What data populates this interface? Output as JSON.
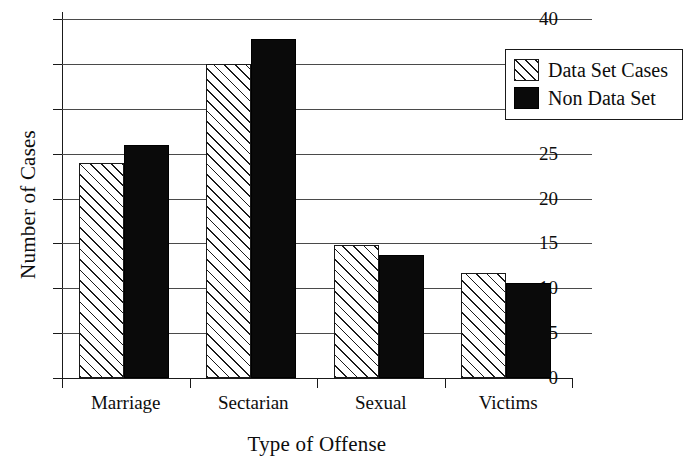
{
  "chart_data": {
    "type": "bar",
    "title": "",
    "xlabel": "Type of Offense",
    "ylabel": "Number of Cases",
    "categories": [
      "Marriage",
      "Sectarian",
      "Sexual",
      "Victims"
    ],
    "series": [
      {
        "name": "Data Set Cases",
        "fill": "hatched",
        "values": [
          24,
          35,
          14.8,
          11.7
        ]
      },
      {
        "name": "Non Data Set",
        "fill": "solid",
        "values": [
          26,
          37.8,
          13.7,
          10.6
        ]
      }
    ],
    "ylim": [
      0,
      40
    ],
    "yticks": [
      0,
      5,
      10,
      15,
      20,
      25,
      30,
      35,
      40
    ],
    "ytick_labels": [
      "0",
      "5",
      "10",
      "15",
      "20",
      "25",
      "30",
      "35",
      "40"
    ],
    "grid": true,
    "legend_position": "top-right",
    "colors": {
      "axis": "#1a1a1a",
      "gridline": "#4a4a4a",
      "series_solid": "#0a0a0a",
      "series_hatch": "#1a1a1a",
      "background": "#ffffff"
    }
  }
}
